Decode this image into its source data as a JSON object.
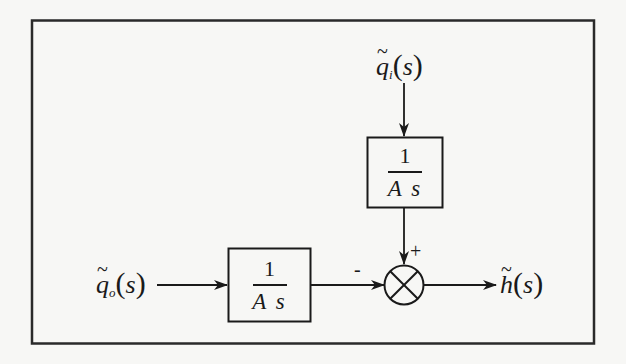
{
  "diagram": {
    "type": "block-diagram",
    "inputs": {
      "top": {
        "symbol": "q",
        "subscript": "i",
        "argument": "s",
        "display": "q̃ᵢ(s)"
      },
      "left": {
        "symbol": "q",
        "subscript": "o",
        "argument": "s",
        "display": "q̃ₒ(s)"
      }
    },
    "output": {
      "symbol": "h",
      "argument": "s",
      "display": "h̃(s)"
    },
    "blocks": [
      {
        "id": "top-block",
        "numerator": "1",
        "denominator": "A s"
      },
      {
        "id": "left-block",
        "numerator": "1",
        "denominator": "A s"
      }
    ],
    "summing_junction": {
      "signs": {
        "top": "+",
        "left": "-"
      }
    },
    "labels": {
      "tilde": "~",
      "open_paren": "(",
      "close_paren": ")"
    },
    "colors": {
      "ink": "#1a1a1a",
      "paper": "#f7f7f5"
    }
  }
}
